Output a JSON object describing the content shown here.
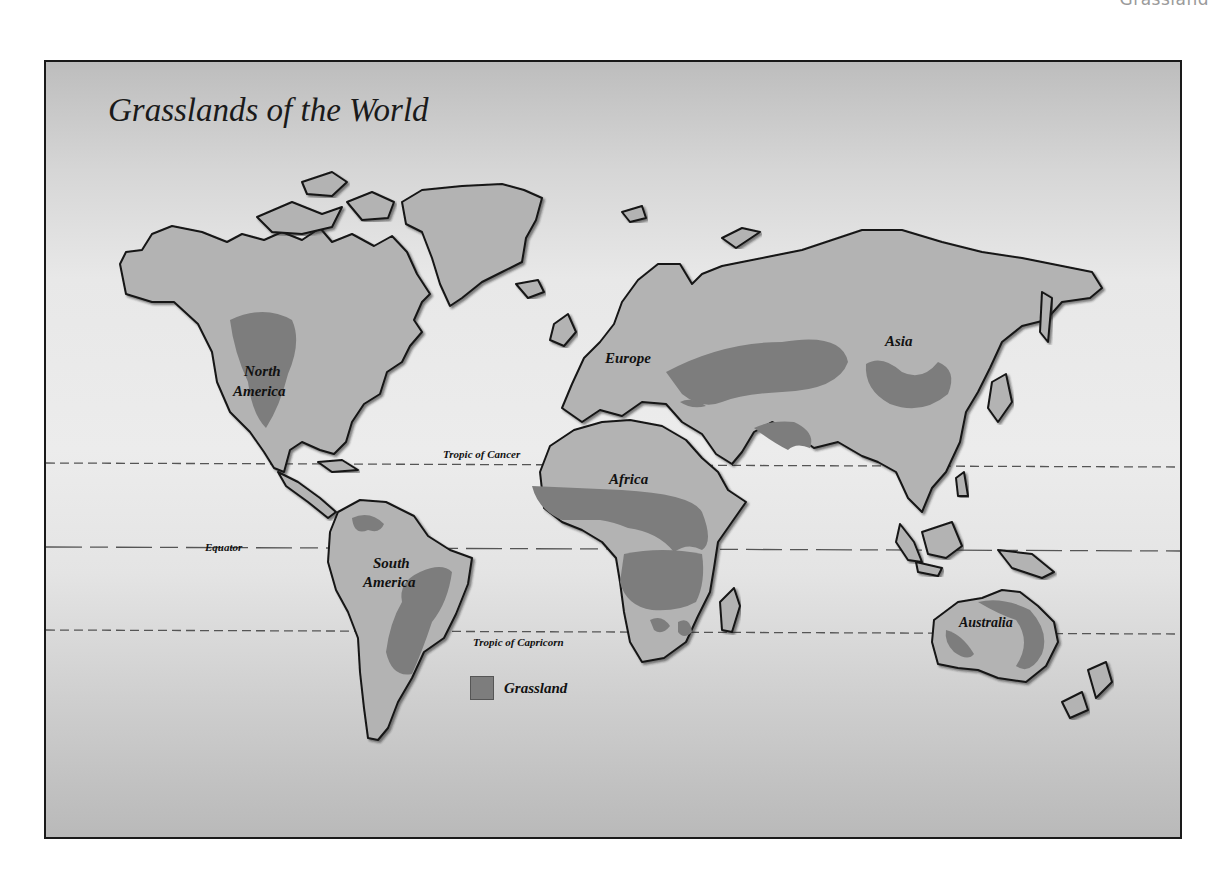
{
  "page": {
    "caption": "Grassland"
  },
  "map": {
    "title": "Grasslands of the World",
    "reference_lines": {
      "tropic_of_cancer": "Tropic of Cancer",
      "equator": "Equator",
      "tropic_of_capricorn": "Tropic of Capricorn"
    },
    "continents": [
      {
        "id": "north-america",
        "line1": "North",
        "line2": "America"
      },
      {
        "id": "south-america",
        "line1": "South",
        "line2": "America"
      },
      {
        "id": "europe",
        "line1": "Europe"
      },
      {
        "id": "africa",
        "line1": "Africa"
      },
      {
        "id": "asia",
        "line1": "Asia"
      },
      {
        "id": "australia",
        "line1": "Australia"
      }
    ],
    "legend": {
      "items": [
        {
          "label": "Grassland",
          "color": "#7d7d7d"
        }
      ]
    },
    "colors": {
      "land": "#b3b3b3",
      "grassland": "#7d7d7d",
      "coastline": "#151515",
      "ocean_light": "#ececec",
      "ocean_dark": "#bdbdbd"
    }
  }
}
